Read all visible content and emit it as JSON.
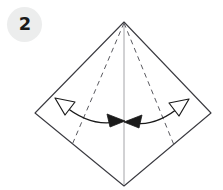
{
  "figure": {
    "name": "origami-step-diagram"
  },
  "step_badge": {
    "number": "2",
    "shape": "circle",
    "fill_color": "#eceded",
    "text_color": "#1a1a1a"
  },
  "canvas": {
    "width": 223,
    "height": 190,
    "background_color": "#ffffff"
  },
  "colors": {
    "outline": "#3a3a40",
    "dashed_fold": "#5a5a60",
    "center_crease": "#9a9a9e",
    "arrow_stroke": "#1a1a1a",
    "arrow_fill_open": "#ffffff",
    "arrow_fill_solid": "#1a1a1a"
  },
  "shapes": {
    "diamond": {
      "name": "paper-outline-diamond",
      "points": "124,22 211,113 124,186 35,113",
      "stroke_width": 1.1,
      "fill": "none"
    },
    "center_crease": {
      "name": "center-vertical-crease",
      "x1": 124,
      "y1": 24,
      "x2": 124,
      "y2": 185,
      "stroke_width": 0.9,
      "style": "solid"
    },
    "dashed_folds": [
      {
        "name": "fold-line-left",
        "x1": 124,
        "y1": 23,
        "x2": 72,
        "y2": 145,
        "dash": "5 4",
        "stroke_width": 1.0
      },
      {
        "name": "fold-line-right",
        "x1": 124,
        "y1": 23,
        "x2": 174,
        "y2": 145,
        "dash": "5 4",
        "stroke_width": 1.0
      }
    ],
    "arrows": [
      {
        "name": "fold-arrow-left",
        "curve": "M 60,103 Q 92,128 121,121",
        "head_start": {
          "name": "arrowhead-open-upleft",
          "points": "56,99 74,102 66,114",
          "fill": "open"
        },
        "head_end": {
          "name": "arrowhead-solid-right",
          "points": "124,121 108,115 110,126",
          "fill": "solid"
        },
        "stroke_width": 1.3
      },
      {
        "name": "fold-arrow-right",
        "curve": "M 184,104 Q 154,128 128,122",
        "head_start": {
          "name": "arrowhead-open-upright",
          "points": "188,100 170,103 178,115",
          "fill": "open"
        },
        "head_end": {
          "name": "arrowhead-solid-left",
          "points": "125,122 141,116 139,127",
          "fill": "solid"
        },
        "stroke_width": 1.3
      }
    ]
  }
}
